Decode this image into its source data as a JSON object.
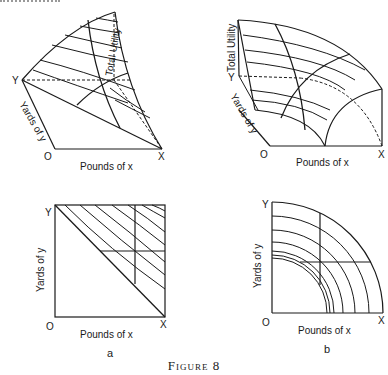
{
  "figure": {
    "caption": "Figure 8",
    "cut_text_fragment": ""
  },
  "panels": {
    "a_top": {
      "y_label": "Y",
      "x_label": "X",
      "origin_label": "O",
      "x_axis_title": "Pounds of x",
      "y_axis_title": "Yards of y",
      "z_axis_title": "Total Utility"
    },
    "b_top": {
      "y_label": "Y",
      "x_label": "X",
      "origin_label": "O",
      "x_axis_title": "Pounds of x",
      "y_axis_title": "Yards of y",
      "z_axis_title": "Total Utility"
    },
    "a_bottom": {
      "y_label": "Y",
      "x_label": "X",
      "origin_label": "O",
      "x_axis_title": "Pounds of x",
      "y_axis_title": "Yards of y",
      "sublabel": "a"
    },
    "b_bottom": {
      "y_label": "Y",
      "x_label": "X",
      "origin_label": "O",
      "x_axis_title": "Pounds of x",
      "y_axis_title": "Yards of y",
      "sublabel": "b"
    }
  },
  "colors": {
    "line": "#1a1a1a",
    "background": "#ffffff"
  }
}
